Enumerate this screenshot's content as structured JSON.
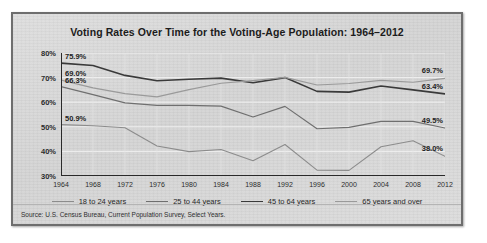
{
  "figure": {
    "title": "Voting Rates Over Time for the Voting-Age Population: 1964–2012",
    "source": "Source: U.S. Census Bureau, Current Population Survey, Select Years."
  },
  "chart_data": {
    "type": "line",
    "title": "Voting Rates Over Time for the Voting-Age Population: 1964–2012",
    "xlabel": "",
    "ylabel": "",
    "xlim": [
      1964,
      2012
    ],
    "ylim": [
      30,
      80
    ],
    "grid": true,
    "legend_position": "bottom",
    "x": [
      1964,
      1968,
      1972,
      1976,
      1980,
      1984,
      1988,
      1992,
      1996,
      2000,
      2004,
      2008,
      2012
    ],
    "categories": [
      "1964",
      "1968",
      "1972",
      "1976",
      "1980",
      "1984",
      "1988",
      "1992",
      "1996",
      "2000",
      "2004",
      "2008",
      "2012"
    ],
    "ytick_labels": [
      "80%",
      "70%",
      "60%",
      "50%",
      "40%",
      "30%"
    ],
    "ytick_values": [
      80,
      70,
      60,
      50,
      40,
      30
    ],
    "series": [
      {
        "name": "18 to 24 years",
        "color": "#8c8c8c",
        "width": 1.1,
        "start_label": "50.9%",
        "end_label": "38.0%",
        "values": [
          50.9,
          50.4,
          49.6,
          42.2,
          39.9,
          40.8,
          36.2,
          42.8,
          32.4,
          32.3,
          41.9,
          44.3,
          38.0
        ]
      },
      {
        "name": "25 to 44 years",
        "color": "#6f6f6f",
        "width": 1.2,
        "start_label": "66.3%",
        "end_label": "49.5%",
        "values": [
          66.3,
          63.1,
          59.7,
          58.7,
          58.7,
          58.4,
          54.0,
          58.3,
          49.2,
          49.8,
          52.2,
          52.2,
          49.5
        ]
      },
      {
        "name": "45 to 64 years",
        "color": "#3a3a3a",
        "width": 1.6,
        "start_label": "75.9%",
        "end_label": "63.4%",
        "values": [
          75.9,
          74.9,
          70.9,
          68.7,
          69.3,
          69.8,
          67.9,
          70.0,
          64.4,
          64.1,
          66.6,
          65.0,
          63.4
        ]
      },
      {
        "name": "65 years and over",
        "color": "#9a9a9a",
        "width": 1.2,
        "start_label": "69.0%",
        "end_label": "69.7%",
        "values": [
          69.0,
          65.8,
          63.5,
          62.2,
          65.1,
          67.7,
          68.8,
          70.1,
          67.0,
          67.6,
          68.9,
          68.1,
          69.7
        ]
      }
    ],
    "left_labels": [
      "75.9%",
      "69.0%",
      "66.3%",
      "50.9%"
    ],
    "right_labels": [
      "69.7%",
      "63.4%",
      "49.5%",
      "38.0%"
    ]
  }
}
